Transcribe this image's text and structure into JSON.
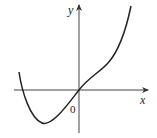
{
  "figure": {
    "axes": {
      "x_label": "x",
      "y_label": "y",
      "origin_label": "0"
    },
    "curve": {
      "description": "Function graph: decreases from upper-left, crosses negative x-axis, reaches a minimum below the axis, rises through the origin, then increases steeply to the upper right",
      "color": "#222222"
    }
  }
}
